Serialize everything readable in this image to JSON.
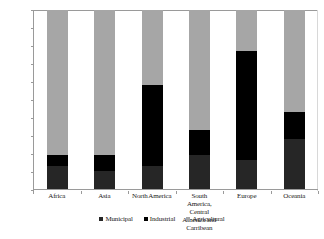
{
  "chart_data": {
    "type": "bar",
    "subtype": "stacked-100-percent",
    "title": "",
    "xlabel": "",
    "ylabel": "",
    "ylim": [
      0,
      100
    ],
    "ytick_labels": [
      "0%",
      "10%",
      "20%",
      "30%",
      "40%",
      "50%",
      "60%",
      "70%",
      "80%",
      "90%",
      "100%"
    ],
    "ytick_values": [
      0,
      10,
      20,
      30,
      40,
      50,
      60,
      70,
      80,
      90,
      100
    ],
    "grid": false,
    "legend_position": "bottom-center",
    "categories": [
      "Africa",
      "Asia",
      "North America",
      "South America, Central America and Carribean",
      "Europe",
      "Oceania"
    ],
    "category_label_lines": [
      [
        "Africa"
      ],
      [
        "Asia"
      ],
      [
        "North America"
      ],
      [
        "South America,",
        "Central",
        "America and",
        "Carribean"
      ],
      [
        "Europe"
      ],
      [
        "Oceania"
      ]
    ],
    "series": [
      {
        "name": "Municipal",
        "color": "#262626",
        "values": [
          13,
          10,
          13,
          19,
          16,
          28
        ]
      },
      {
        "name": "Industrial",
        "color": "#000000",
        "values": [
          6,
          9,
          45,
          14,
          61,
          15
        ]
      },
      {
        "name": "Agricultural",
        "color": "#a6a6a6",
        "values": [
          81,
          81,
          42,
          67,
          23,
          57
        ]
      }
    ],
    "cumulative_tops": {
      "municipal": [
        13,
        10,
        13,
        19,
        16,
        28
      ],
      "industrial": [
        19,
        19,
        58,
        33,
        77,
        43
      ],
      "agricultural": [
        100,
        100,
        100,
        100,
        100,
        100
      ]
    },
    "axis_color": "#9a9a9a"
  },
  "legend": {
    "items": [
      {
        "label": "Municipal",
        "swatch": "#262626"
      },
      {
        "label": "Industrial",
        "swatch": "#000000"
      },
      {
        "label": "Agricultural",
        "swatch": "#a6a6a6"
      }
    ]
  }
}
